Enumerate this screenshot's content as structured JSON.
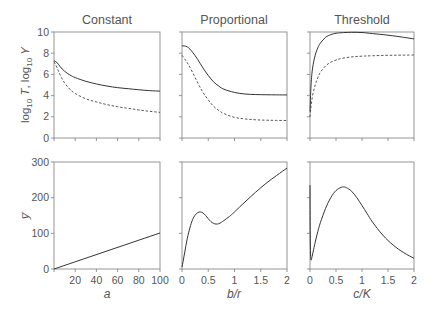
{
  "chart_data": [
    {
      "type": "line",
      "panel": "top-constant",
      "title": "Constant",
      "xlabel": "",
      "ylabel": "log10 T, log10 Y",
      "xlim": [
        0,
        100
      ],
      "ylim": [
        0,
        10
      ],
      "yticks": [
        0,
        2,
        4,
        6,
        8,
        10
      ],
      "xticks": [
        0,
        20,
        40,
        60,
        80,
        100
      ],
      "show_xtick_labels": false,
      "series": [
        {
          "name": "log10 T",
          "style": "solid",
          "x": [
            0,
            3,
            6,
            10,
            15,
            20,
            30,
            40,
            50,
            60,
            70,
            80,
            90,
            100
          ],
          "y": [
            7.3,
            7.1,
            6.7,
            6.3,
            5.95,
            5.7,
            5.35,
            5.1,
            4.9,
            4.75,
            4.65,
            4.55,
            4.47,
            4.42
          ]
        },
        {
          "name": "log10 Y",
          "style": "dashed",
          "x": [
            0,
            3,
            6,
            10,
            15,
            20,
            30,
            40,
            50,
            60,
            70,
            80,
            90,
            100
          ],
          "y": [
            7.2,
            6.6,
            5.9,
            5.2,
            4.6,
            4.2,
            3.7,
            3.4,
            3.15,
            2.95,
            2.8,
            2.65,
            2.52,
            2.42
          ]
        }
      ]
    },
    {
      "type": "line",
      "panel": "top-proportional",
      "title": "Proportional",
      "xlabel": "",
      "ylabel": "",
      "xlim": [
        0,
        2
      ],
      "ylim": [
        0,
        10
      ],
      "xticks": [
        0,
        0.5,
        1,
        1.5,
        2
      ],
      "yticks": [
        0,
        2,
        4,
        6,
        8,
        10
      ],
      "show_xtick_labels": false,
      "show_ytick_labels": false,
      "series": [
        {
          "name": "log10 T",
          "style": "solid",
          "x": [
            0,
            0.1,
            0.2,
            0.3,
            0.4,
            0.5,
            0.6,
            0.7,
            0.8,
            1.0,
            1.2,
            1.4,
            1.6,
            1.8,
            2.0
          ],
          "y": [
            8.7,
            8.6,
            8.1,
            7.4,
            6.6,
            5.9,
            5.3,
            4.9,
            4.6,
            4.3,
            4.15,
            4.1,
            4.08,
            4.07,
            4.06
          ]
        },
        {
          "name": "log10 Y",
          "style": "dashed",
          "x": [
            0,
            0.1,
            0.2,
            0.3,
            0.4,
            0.5,
            0.6,
            0.7,
            0.8,
            1.0,
            1.2,
            1.4,
            1.6,
            1.8,
            2.0
          ],
          "y": [
            7.8,
            7.1,
            6.2,
            5.2,
            4.3,
            3.6,
            3.0,
            2.6,
            2.3,
            1.95,
            1.8,
            1.72,
            1.68,
            1.66,
            1.65
          ]
        }
      ]
    },
    {
      "type": "line",
      "panel": "top-threshold",
      "title": "Threshold",
      "xlabel": "",
      "ylabel": "",
      "xlim": [
        0,
        2
      ],
      "ylim": [
        0,
        10
      ],
      "xticks": [
        0,
        0.5,
        1,
        1.5,
        2
      ],
      "yticks": [
        0,
        2,
        4,
        6,
        8,
        10
      ],
      "show_xtick_labels": false,
      "show_ytick_labels": false,
      "series": [
        {
          "name": "log10 T",
          "style": "solid",
          "x": [
            0,
            0.02,
            0.05,
            0.1,
            0.15,
            0.2,
            0.3,
            0.4,
            0.5,
            0.6,
            0.8,
            1.0,
            1.2,
            1.5,
            1.8,
            2.0
          ],
          "y": [
            2.5,
            5.0,
            6.6,
            7.8,
            8.5,
            8.95,
            9.5,
            9.75,
            9.88,
            9.93,
            9.97,
            9.95,
            9.85,
            9.7,
            9.5,
            9.35
          ]
        },
        {
          "name": "log10 Y",
          "style": "dashed",
          "x": [
            0,
            0.02,
            0.05,
            0.1,
            0.15,
            0.2,
            0.3,
            0.4,
            0.5,
            0.6,
            0.8,
            1.0,
            1.2,
            1.5,
            1.8,
            2.0
          ],
          "y": [
            2.0,
            3.0,
            4.0,
            5.0,
            5.7,
            6.2,
            6.8,
            7.15,
            7.35,
            7.5,
            7.65,
            7.72,
            7.76,
            7.8,
            7.82,
            7.83
          ]
        }
      ]
    },
    {
      "type": "line",
      "panel": "bottom-constant",
      "title": "",
      "xlabel": "a",
      "ylabel": "y̅",
      "xlim": [
        0,
        100
      ],
      "ylim": [
        0,
        300
      ],
      "xticks": [
        0,
        20,
        40,
        60,
        80,
        100
      ],
      "xtick_labels": [
        "",
        "20",
        "40",
        "60",
        "80",
        "100"
      ],
      "yticks": [
        0,
        100,
        200,
        300
      ],
      "series": [
        {
          "name": "mean y",
          "style": "solid",
          "x": [
            0,
            100
          ],
          "y": [
            0,
            101
          ]
        }
      ]
    },
    {
      "type": "line",
      "panel": "bottom-proportional",
      "title": "",
      "xlabel": "b/r",
      "ylabel": "",
      "xlim": [
        0,
        2
      ],
      "ylim": [
        0,
        300
      ],
      "xticks": [
        0,
        0.5,
        1,
        1.5,
        2
      ],
      "xtick_labels": [
        "0",
        "0.5",
        "1",
        "1.5",
        "2"
      ],
      "yticks": [
        0,
        100,
        200,
        300
      ],
      "show_ytick_labels": false,
      "series": [
        {
          "name": "mean y",
          "style": "solid",
          "x": [
            0,
            0.05,
            0.1,
            0.15,
            0.2,
            0.25,
            0.3,
            0.35,
            0.4,
            0.45,
            0.5,
            0.55,
            0.6,
            0.65,
            0.7,
            0.75,
            0.8,
            0.9,
            1.0,
            1.2,
            1.4,
            1.6,
            1.8,
            2.0
          ],
          "y": [
            5,
            45,
            85,
            115,
            138,
            151,
            158,
            160,
            157,
            150,
            141,
            133,
            128,
            126,
            127,
            131,
            136,
            147,
            160,
            188,
            215,
            240,
            262,
            283
          ]
        }
      ]
    },
    {
      "type": "line",
      "panel": "bottom-threshold",
      "title": "",
      "xlabel": "c/K",
      "ylabel": "",
      "xlim": [
        0,
        2
      ],
      "ylim": [
        0,
        300
      ],
      "xticks": [
        0,
        0.5,
        1,
        1.5,
        2
      ],
      "xtick_labels": [
        "0",
        "0.5",
        "1",
        "1.5",
        "2"
      ],
      "yticks": [
        0,
        100,
        200,
        300
      ],
      "show_ytick_labels": false,
      "series": [
        {
          "name": "mean y",
          "style": "solid",
          "x": [
            0.0,
            0.003,
            0.01,
            0.02,
            0.04,
            0.07,
            0.1,
            0.15,
            0.2,
            0.3,
            0.4,
            0.5,
            0.6,
            0.65,
            0.7,
            0.8,
            0.9,
            1.0,
            1.1,
            1.2,
            1.4,
            1.6,
            1.8,
            2.0
          ],
          "y": [
            235,
            120,
            45,
            25,
            35,
            55,
            75,
            105,
            130,
            170,
            200,
            220,
            229,
            230,
            228,
            218,
            200,
            178,
            155,
            132,
            95,
            67,
            46,
            30
          ]
        }
      ]
    }
  ],
  "figure": {
    "titles": [
      "Constant",
      "Proportional",
      "Threshold"
    ],
    "top_ylabel_main": "log",
    "top_ylabel_sub": "10",
    "top_ylabel_T": "T",
    "top_ylabel_sep": ",",
    "top_ylabel_Y": "Y",
    "bottom_ylabel": "y̅",
    "xlabels": [
      "a",
      "b/r",
      "c/K"
    ]
  }
}
